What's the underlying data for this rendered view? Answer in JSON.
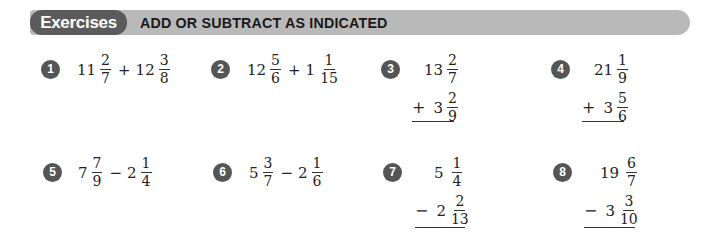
{
  "header": {
    "label": "Exercises",
    "title": "ADD OR SUBTRACT AS INDICATED",
    "colors": {
      "pill": "#5b5b5b",
      "bar": "#b9b9b9"
    }
  },
  "exercises": [
    {
      "number": "1",
      "layout": "inline",
      "a": {
        "whole": "11",
        "num": "2",
        "den": "7"
      },
      "op": "+",
      "b": {
        "whole": "12",
        "num": "3",
        "den": "8"
      }
    },
    {
      "number": "2",
      "layout": "inline",
      "a": {
        "whole": "12",
        "num": "5",
        "den": "6"
      },
      "op": "+",
      "b": {
        "whole": "1",
        "num": "1",
        "den": "15"
      }
    },
    {
      "number": "3",
      "layout": "vertical",
      "a": {
        "whole": "13",
        "num": "2",
        "den": "7"
      },
      "op": "+",
      "b": {
        "whole": "3",
        "num": "2",
        "den": "9"
      }
    },
    {
      "number": "4",
      "layout": "vertical",
      "a": {
        "whole": "21",
        "num": "1",
        "den": "9"
      },
      "op": "+",
      "b": {
        "whole": "3",
        "num": "5",
        "den": "6"
      }
    },
    {
      "number": "5",
      "layout": "inline",
      "a": {
        "whole": "7",
        "num": "7",
        "den": "9"
      },
      "op": "−",
      "b": {
        "whole": "2",
        "num": "1",
        "den": "4"
      }
    },
    {
      "number": "6",
      "layout": "inline",
      "a": {
        "whole": "5",
        "num": "3",
        "den": "7"
      },
      "op": "−",
      "b": {
        "whole": "2",
        "num": "1",
        "den": "6"
      }
    },
    {
      "number": "7",
      "layout": "vertical",
      "a": {
        "whole": "5",
        "num": "1",
        "den": "4"
      },
      "op": "−",
      "b": {
        "whole": "2",
        "num": "2",
        "den": "13"
      }
    },
    {
      "number": "8",
      "layout": "vertical",
      "a": {
        "whole": "19",
        "num": "6",
        "den": "7"
      },
      "op": "−",
      "b": {
        "whole": "3",
        "num": "3",
        "den": "10"
      }
    }
  ]
}
